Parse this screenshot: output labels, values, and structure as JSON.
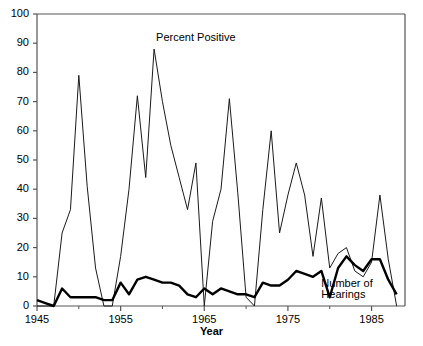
{
  "chart_data": {
    "type": "line",
    "title": "",
    "xlabel": "Year",
    "ylabel": "",
    "xlim": [
      1945,
      1989
    ],
    "ylim": [
      0,
      100
    ],
    "grid": false,
    "legend_position": "inline-annotation",
    "yticks": [
      0,
      10,
      20,
      30,
      40,
      50,
      60,
      70,
      80,
      90,
      100
    ],
    "xticks": [
      1945,
      1955,
      1965,
      1975,
      1985
    ],
    "xticks_minor": [
      1950,
      1960,
      1970,
      1980
    ],
    "series": [
      {
        "name": "Percent Positive",
        "style": "thin",
        "color": "#1a1a1a",
        "x": [
          1945,
          1946,
          1947,
          1948,
          1949,
          1950,
          1951,
          1952,
          1953,
          1954,
          1955,
          1956,
          1957,
          1958,
          1959,
          1960,
          1961,
          1962,
          1963,
          1964,
          1965,
          1966,
          1967,
          1968,
          1969,
          1970,
          1971,
          1972,
          1973,
          1974,
          1975,
          1976,
          1977,
          1978,
          1979,
          1980,
          1981,
          1982,
          1983,
          1984,
          1985,
          1986,
          1987,
          1988
        ],
        "values": [
          0,
          0,
          0,
          25,
          33,
          79,
          41,
          13,
          0,
          0,
          17,
          40,
          72,
          44,
          88,
          70,
          55,
          44,
          33,
          49,
          0,
          29,
          40,
          71,
          39,
          3,
          0,
          33,
          60,
          25,
          38,
          49,
          38,
          17,
          37,
          13,
          18,
          20,
          12,
          10,
          15,
          38,
          16,
          0
        ]
      },
      {
        "name": "Number of Hearings",
        "style": "thick",
        "color": "#000000",
        "x": [
          1945,
          1946,
          1947,
          1948,
          1949,
          1950,
          1951,
          1952,
          1953,
          1954,
          1955,
          1956,
          1957,
          1958,
          1959,
          1960,
          1961,
          1962,
          1963,
          1964,
          1965,
          1966,
          1967,
          1968,
          1969,
          1970,
          1971,
          1972,
          1973,
          1974,
          1975,
          1976,
          1977,
          1978,
          1979,
          1980,
          1981,
          1982,
          1983,
          1984,
          1985,
          1986,
          1987,
          1988
        ],
        "values": [
          2,
          1,
          0,
          6,
          3,
          3,
          3,
          3,
          2,
          2,
          8,
          4,
          9,
          10,
          9,
          8,
          8,
          7,
          4,
          3,
          6,
          4,
          6,
          5,
          4,
          4,
          3,
          8,
          7,
          7,
          9,
          12,
          11,
          10,
          12,
          3,
          13,
          17,
          14,
          12,
          16,
          16,
          9,
          4
        ]
      }
    ],
    "annotations": [
      {
        "text": "Percent Positive",
        "x": 1959,
        "y": 92
      },
      {
        "text": "Number of",
        "x": 1979,
        "y": 8
      },
      {
        "text": "Hearings",
        "x": 1979,
        "y": 4
      }
    ]
  },
  "axis": {
    "y_labels": [
      "100",
      "90",
      "80",
      "70",
      "60",
      "50",
      "40",
      "30",
      "20",
      "10",
      "0"
    ],
    "x_labels": [
      "1945",
      "1955",
      "1965",
      "1975",
      "1985"
    ],
    "x_title": "Year"
  },
  "labels": {
    "percent_positive": "Percent Positive",
    "number_of_line1": "Number of",
    "number_of_line2": "Hearings"
  }
}
